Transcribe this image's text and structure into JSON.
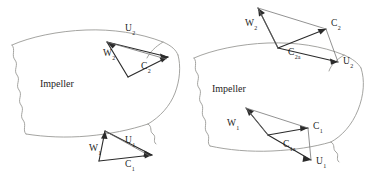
{
  "figure": {
    "domain": "Diagram",
    "background_color": "#ffffff",
    "vector_color": "#2b2b2b",
    "outline_color": "#9a9a96",
    "label_color": "#1d1d1d"
  },
  "left_diagram": {
    "body_label": "Impeller",
    "outlet_triangle": {
      "name": "outlet-velocity-triangle",
      "labels": {
        "u": {
          "symbol": "U",
          "subscript": "2"
        },
        "w": {
          "symbol": "W",
          "subscript": "2"
        },
        "c": {
          "symbol": "C",
          "subscript": "2"
        }
      }
    },
    "inlet_triangle": {
      "name": "inlet-velocity-triangle",
      "labels": {
        "u": {
          "symbol": "U",
          "subscript": "1"
        },
        "w": {
          "symbol": "W",
          "subscript": "1"
        },
        "c": {
          "symbol": "C",
          "subscript": "1"
        }
      }
    }
  },
  "right_diagram": {
    "body_label": "Impeller",
    "outlet_triangle": {
      "name": "outlet-velocity-triangle",
      "labels": {
        "u": {
          "symbol": "U",
          "subscript": "2"
        },
        "w": {
          "symbol": "W",
          "subscript": "2"
        },
        "c": {
          "symbol": "C",
          "subscript": "2"
        },
        "ca": {
          "symbol": "C",
          "subscript": "2a"
        }
      }
    },
    "inlet_triangle": {
      "name": "inlet-velocity-triangle",
      "labels": {
        "u": {
          "symbol": "U",
          "subscript": "1"
        },
        "w": {
          "symbol": "W",
          "subscript": "1"
        },
        "c": {
          "symbol": "C",
          "subscript": "1"
        },
        "ca": {
          "symbol": "C",
          "subscript": "1a"
        }
      }
    }
  }
}
